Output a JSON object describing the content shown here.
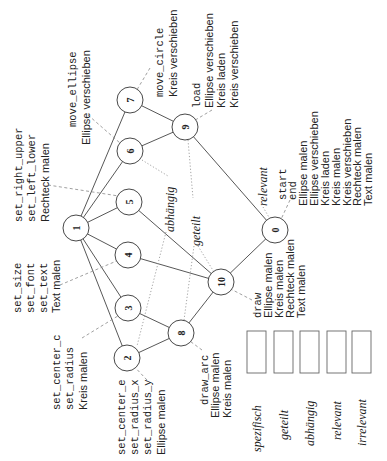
{
  "diagram": {
    "orientation": "rotated-90-ccw",
    "nodes": [
      {
        "id": "0",
        "x": 275,
        "y": 230,
        "labels": [
          {
            "text": "start",
            "style": "mono"
          },
          {
            "text": "end",
            "style": "mono"
          },
          {
            "text": "Ellipse malen",
            "style": "sans"
          },
          {
            "text": "Ellipse verschieben",
            "style": "sans"
          },
          {
            "text": "Kreis laden",
            "style": "sans"
          },
          {
            "text": "Kreis malen",
            "style": "sans"
          },
          {
            "text": "Kreis verschieben",
            "style": "sans"
          },
          {
            "text": "Rechteck malen",
            "style": "sans"
          },
          {
            "text": "Text malen",
            "style": "sans"
          }
        ]
      },
      {
        "id": "1",
        "x": 76,
        "y": 228,
        "labels": []
      },
      {
        "id": "2",
        "x": 127,
        "y": 358,
        "labels": [
          {
            "text": "set_center_e",
            "style": "mono"
          },
          {
            "text": "set_radius_x",
            "style": "mono"
          },
          {
            "text": "set_radius_y",
            "style": "mono"
          },
          {
            "text": "Ellipse malen",
            "style": "sans"
          }
        ]
      },
      {
        "id": "3",
        "x": 128,
        "y": 308,
        "labels": [
          {
            "text": "set_center_c",
            "style": "mono"
          },
          {
            "text": "set_radius",
            "style": "mono"
          },
          {
            "text": "Kreis malen",
            "style": "sans"
          }
        ]
      },
      {
        "id": "4",
        "x": 128,
        "y": 255,
        "labels": [
          {
            "text": "set_size",
            "style": "mono"
          },
          {
            "text": "set_font",
            "style": "mono"
          },
          {
            "text": "set_text",
            "style": "mono"
          },
          {
            "text": "Text malen",
            "style": "sans"
          }
        ]
      },
      {
        "id": "5",
        "x": 129,
        "y": 202,
        "labels": [
          {
            "text": "set_right_upper",
            "style": "mono"
          },
          {
            "text": "set_left_lower",
            "style": "mono"
          },
          {
            "text": "Rechteck malen",
            "style": "sans"
          }
        ]
      },
      {
        "id": "6",
        "x": 130,
        "y": 151,
        "labels": [
          {
            "text": "move_ellipse",
            "style": "mono"
          },
          {
            "text": "Ellipse verschieben",
            "style": "sans"
          }
        ]
      },
      {
        "id": "7",
        "x": 130,
        "y": 100,
        "labels": [
          {
            "text": "move_circle",
            "style": "mono"
          },
          {
            "text": "Kreis verschieben",
            "style": "sans"
          }
        ]
      },
      {
        "id": "8",
        "x": 181,
        "y": 333,
        "labels": [
          {
            "text": "draw_arc",
            "style": "mono"
          },
          {
            "text": "Ellipse malen",
            "style": "sans"
          },
          {
            "text": "Kreis malen",
            "style": "sans"
          }
        ]
      },
      {
        "id": "9",
        "x": 185,
        "y": 127,
        "labels": [
          {
            "text": "load",
            "style": "mono"
          },
          {
            "text": "Ellipse verschieben",
            "style": "sans"
          },
          {
            "text": "Kreis laden",
            "style": "sans"
          },
          {
            "text": "Kreis verschieben",
            "style": "sans"
          }
        ]
      },
      {
        "id": "10",
        "x": 221,
        "y": 282,
        "labels": [
          {
            "text": "draw",
            "style": "mono"
          },
          {
            "text": "Ellipse malen",
            "style": "sans"
          },
          {
            "text": "Kreis malen",
            "style": "sans"
          },
          {
            "text": "Rechteck malen",
            "style": "sans"
          },
          {
            "text": "Text malen",
            "style": "sans"
          }
        ]
      }
    ],
    "edges": [
      [
        "1",
        "2"
      ],
      [
        "1",
        "3"
      ],
      [
        "1",
        "4"
      ],
      [
        "1",
        "5"
      ],
      [
        "1",
        "6"
      ],
      [
        "1",
        "7"
      ],
      [
        "2",
        "8"
      ],
      [
        "3",
        "8"
      ],
      [
        "4",
        "10"
      ],
      [
        "5",
        "10"
      ],
      [
        "6",
        "9"
      ],
      [
        "7",
        "9"
      ],
      [
        "8",
        "10"
      ],
      [
        "9",
        "0"
      ],
      [
        "10",
        "0"
      ]
    ],
    "region_labels": [
      {
        "text": "abhängig",
        "x": 170,
        "y": 203
      },
      {
        "text": "geteilt",
        "x": 197,
        "y": 222
      },
      {
        "text": "relevant",
        "x": 263,
        "y": 183
      }
    ],
    "legend": [
      {
        "label": "spezifisch"
      },
      {
        "label": "geteilt"
      },
      {
        "label": "abhängig"
      },
      {
        "label": "relevant"
      },
      {
        "label": "irrelevant"
      }
    ]
  }
}
